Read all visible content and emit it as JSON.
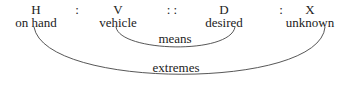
{
  "terms": [
    {
      "symbol": "H",
      "label": "on hand",
      "x": 36
    },
    {
      "symbol": "V",
      "label": "vehicle",
      "x": 118
    },
    {
      "symbol": "D",
      "label": "desired",
      "x": 224
    },
    {
      "symbol": "X",
      "label": "unknown",
      "x": 310
    }
  ],
  "separators": [
    {
      "text": ":",
      "x": 77
    },
    {
      "text": ": :",
      "x": 172
    },
    {
      "text": ":",
      "x": 281
    }
  ],
  "arcs": {
    "means_label": "means",
    "extremes_label": "extremes"
  }
}
